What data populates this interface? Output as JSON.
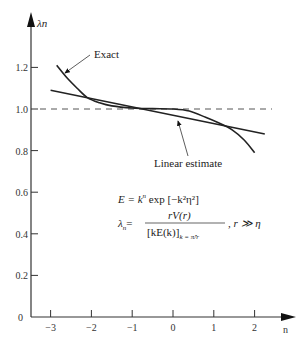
{
  "chart_data": {
    "type": "line",
    "title": "",
    "xlabel": "n",
    "ylabel": "λn",
    "xlim": [
      -3.5,
      3.0
    ],
    "ylim": [
      0,
      1.5
    ],
    "xticks": [
      -3,
      -2,
      -1,
      0,
      1,
      2
    ],
    "xtick_labels": [
      "−3",
      "−2",
      "−1",
      "0",
      "1",
      "2"
    ],
    "yticks": [
      0,
      0.2,
      0.4,
      0.6,
      0.8,
      1.0,
      1.2
    ],
    "ytick_labels": [
      "0",
      "0.2",
      "0.4",
      "0.6",
      "0.8",
      "1.0",
      "1.2"
    ],
    "grid": false,
    "reference_line": {
      "y": 1.0,
      "style": "dashed"
    },
    "series": [
      {
        "name": "Exact",
        "style": "solid",
        "points": [
          [
            -2.85,
            1.21
          ],
          [
            -2.6,
            1.15
          ],
          [
            -2.35,
            1.1
          ],
          [
            -2.1,
            1.055
          ],
          [
            -1.8,
            1.03
          ],
          [
            -1.5,
            1.015
          ],
          [
            -1.0,
            1.005
          ],
          [
            -0.5,
            1.002
          ],
          [
            0.0,
            1.0
          ],
          [
            0.4,
            0.99
          ],
          [
            0.8,
            0.96
          ],
          [
            1.1,
            0.935
          ],
          [
            1.45,
            0.9
          ],
          [
            1.75,
            0.85
          ],
          [
            2.0,
            0.79
          ]
        ]
      },
      {
        "name": "Linear estimate",
        "style": "solid",
        "points": [
          [
            -3.0,
            1.09
          ],
          [
            2.25,
            0.88
          ]
        ]
      }
    ],
    "annotations": [
      {
        "text": "Exact",
        "points_to_series": "Exact",
        "target": [
          -2.8,
          1.18
        ]
      },
      {
        "text": "Linear estimate",
        "points_to_series": "Linear estimate",
        "target": [
          0.1,
          0.96
        ]
      }
    ],
    "formula": {
      "line1_lhs": "E = k",
      "line1_exp": "n",
      "line1_rhs": " exp [−k²η²]",
      "line2_lhs": "λ",
      "line2_lhs_sub": "n",
      "line2_eq": "=",
      "line2_num": "rV(r)",
      "line2_den": "[kE(k)]",
      "line2_den_sub": "k = π̂/r",
      "line2_cond": ", r ≫ η"
    }
  }
}
